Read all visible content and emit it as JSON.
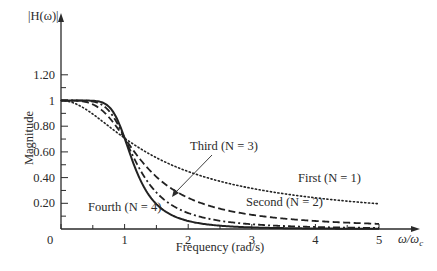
{
  "chart_data": {
    "type": "line",
    "title": "",
    "xlabel": "Frequency (rad/s)",
    "x_axis_end_label": "ω/ω_c",
    "ylabel": "Magnitude",
    "y_axis_top_label": "|H(ω)|",
    "xlim": [
      0,
      5
    ],
    "ylim": [
      0,
      1.2
    ],
    "x_ticks": [
      "0",
      "1",
      "2",
      "3",
      "4",
      "5"
    ],
    "y_ticks": [
      "0.20",
      "0.40",
      "0.60",
      "0.80",
      "1",
      "1.20"
    ],
    "grid": false,
    "legend": "inline annotations",
    "x": [
      0,
      0.25,
      0.5,
      0.75,
      1,
      1.25,
      1.5,
      2,
      2.5,
      3,
      3.5,
      4,
      4.5,
      5
    ],
    "series": [
      {
        "name": "First (N = 1)",
        "style": "dotted",
        "values": [
          1.0,
          0.97,
          0.894,
          0.8,
          0.707,
          0.625,
          0.555,
          0.447,
          0.371,
          0.316,
          0.275,
          0.243,
          0.217,
          0.196
        ]
      },
      {
        "name": "Second (N = 2)",
        "style": "dashed",
        "values": [
          1.0,
          0.998,
          0.97,
          0.872,
          0.707,
          0.539,
          0.406,
          0.243,
          0.158,
          0.11,
          0.081,
          0.062,
          0.049,
          0.04
        ]
      },
      {
        "name": "Third (N = 3)",
        "style": "dash-dot",
        "values": [
          1.0,
          1.0,
          0.992,
          0.919,
          0.707,
          0.456,
          0.284,
          0.124,
          0.064,
          0.037,
          0.023,
          0.016,
          0.011,
          0.008
        ]
      },
      {
        "name": "Fourth (N = 4)",
        "style": "solid",
        "values": [
          1.0,
          1.0,
          0.998,
          0.95,
          0.707,
          0.384,
          0.194,
          0.062,
          0.026,
          0.012,
          0.007,
          0.004,
          0.002,
          0.002
        ]
      }
    ],
    "annotations": [
      {
        "text": "First (N = 1)",
        "near_x": 4.3,
        "near_y": 0.3
      },
      {
        "text": "Second (N = 2)",
        "near_x": 3.5,
        "near_y": 0.18
      },
      {
        "text": "Third (N = 3)",
        "near_x": 2.1,
        "near_y": 0.45,
        "arrow_to": [
          1.55,
          0.19
        ]
      },
      {
        "text": "Fourth (N = 4)",
        "near_x": 1.0,
        "near_y": 0.08
      }
    ]
  },
  "labels": {
    "y_top": "|H(ω)|",
    "y_axis": "Magnitude",
    "x_axis": "Frequency (rad/s)",
    "x_end_omega": "ω/ω",
    "x_end_sub": "c",
    "origin": "0",
    "first": "First (N = 1)",
    "second": "Second (N = 2)",
    "third": "Third (N = 3)",
    "fourth": "Fourth (N = 4)"
  }
}
